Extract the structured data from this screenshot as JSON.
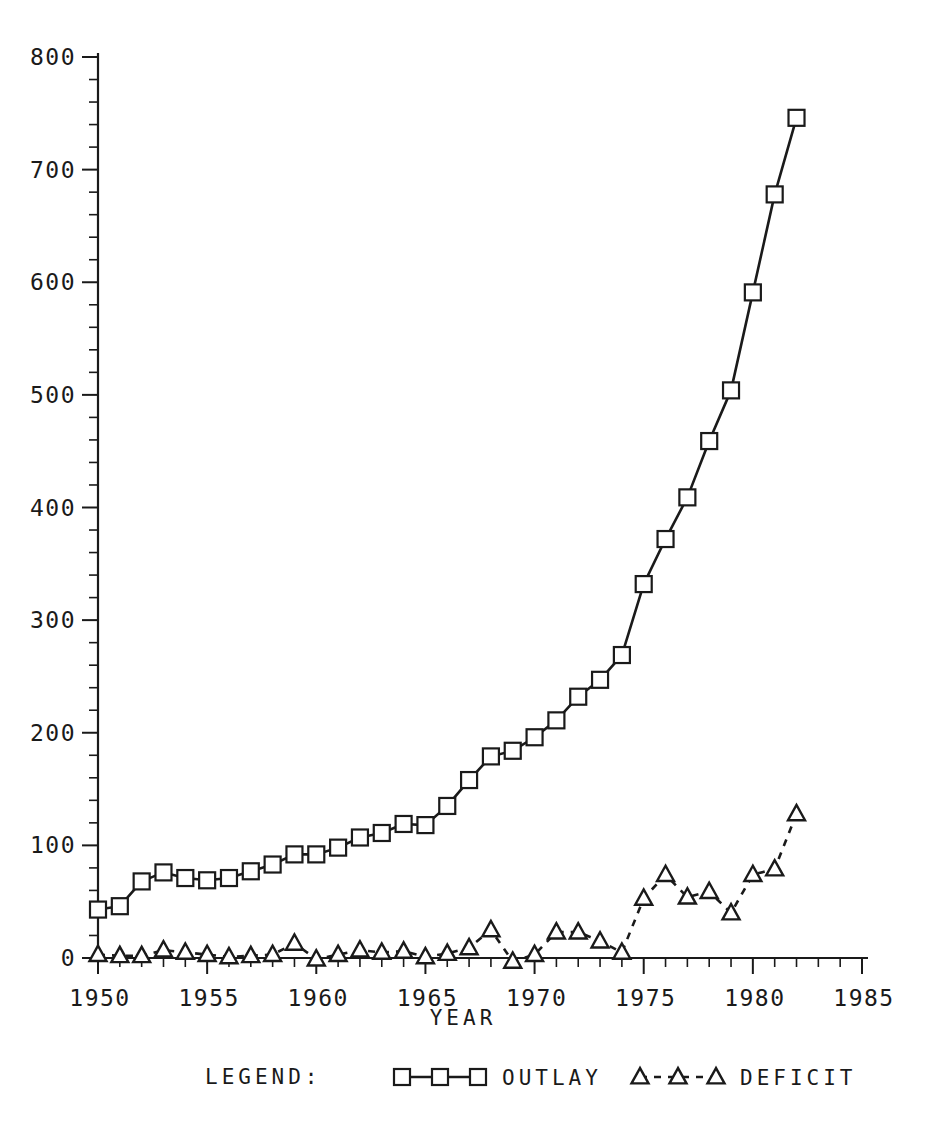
{
  "chart_data": {
    "type": "line",
    "title": "",
    "xlabel": "YEAR",
    "ylabel": "",
    "xlim": [
      1950,
      1985
    ],
    "ylim": [
      0,
      800
    ],
    "grid": false,
    "legend_position": "bottom",
    "legend_label": "LEGEND:",
    "x_ticks": [
      "1950",
      "1955",
      "1960",
      "1965",
      "1970",
      "1975",
      "1980",
      "1985"
    ],
    "x_tick_values": [
      1950,
      1955,
      1960,
      1965,
      1970,
      1975,
      1980,
      1985
    ],
    "x_minor_step": 1,
    "y_ticks": [
      "0",
      "100",
      "200",
      "300",
      "400",
      "500",
      "600",
      "700",
      "800"
    ],
    "y_tick_values": [
      0,
      100,
      200,
      300,
      400,
      500,
      600,
      700,
      800
    ],
    "y_minor_step": 20,
    "x": [
      1950,
      1951,
      1952,
      1953,
      1954,
      1955,
      1956,
      1957,
      1958,
      1959,
      1960,
      1961,
      1962,
      1963,
      1964,
      1965,
      1966,
      1967,
      1968,
      1969,
      1970,
      1971,
      1972,
      1973,
      1974,
      1975,
      1976,
      1977,
      1978,
      1979,
      1980,
      1981,
      1982
    ],
    "series": [
      {
        "name": "OUTLAY",
        "marker": "square",
        "linestyle": "solid",
        "values": [
          43,
          46,
          68,
          76,
          71,
          69,
          71,
          77,
          83,
          92,
          92,
          98,
          107,
          111,
          119,
          118,
          135,
          158,
          179,
          184,
          196,
          211,
          232,
          247,
          269,
          332,
          372,
          409,
          459,
          504,
          591,
          678,
          746
        ]
      },
      {
        "name": "DEFICIT",
        "marker": "triangle",
        "linestyle": "dashed",
        "values": [
          3,
          2,
          2,
          7,
          5,
          3,
          1,
          2,
          3,
          13,
          -1,
          3,
          7,
          5,
          6,
          1,
          4,
          9,
          25,
          -3,
          3,
          23,
          23,
          15,
          5,
          53,
          74,
          54,
          59,
          40,
          74,
          79,
          128
        ]
      }
    ],
    "legend_entries": [
      {
        "label": "OUTLAY",
        "marker": "square",
        "linestyle": "solid"
      },
      {
        "label": "DEFICIT",
        "marker": "triangle",
        "linestyle": "dashed"
      }
    ],
    "colors": {
      "ink": "#1a1a1a",
      "background": "#ffffff",
      "marker_fill": "#ffffff"
    }
  }
}
